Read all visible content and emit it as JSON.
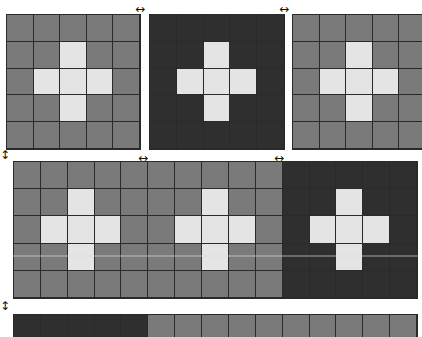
{
  "colors": {
    "grey": "#7a7a7a",
    "dark": "#2f2f2f",
    "light": "#e4e4e4",
    "grid": "#2a2a2a"
  },
  "cross_pattern": [
    [
      0,
      0,
      0,
      0,
      0
    ],
    [
      0,
      0,
      1,
      0,
      0
    ],
    [
      0,
      1,
      1,
      1,
      0
    ],
    [
      0,
      0,
      1,
      0,
      0
    ],
    [
      0,
      0,
      0,
      0,
      0
    ]
  ],
  "top_row": {
    "panels": [
      {
        "name": "panel-top-1",
        "x": 6,
        "y": 14,
        "w": 135,
        "h": 136,
        "cols": 5,
        "rows": 5,
        "base": "grey",
        "cross": true
      },
      {
        "name": "panel-top-2",
        "x": 149,
        "y": 14,
        "w": 136,
        "h": 136,
        "cols": 5,
        "rows": 5,
        "base": "dark",
        "cross": true
      },
      {
        "name": "panel-top-3",
        "x": 292,
        "y": 14,
        "w": 135,
        "h": 136,
        "cols": 5,
        "rows": 5,
        "base": "grey",
        "cross": true
      }
    ]
  },
  "middle_row": {
    "x": 13,
    "y": 161,
    "w": 405,
    "h": 138,
    "cols": 15,
    "rows": 5,
    "blocks": [
      "grey",
      "grey",
      "dark"
    ],
    "cross": true
  },
  "bottom_row": {
    "x": 13,
    "y": 314,
    "w": 405,
    "h": 30,
    "cols": 15,
    "rows": 1,
    "cells": [
      "dark",
      "dark",
      "dark",
      "dark",
      "dark",
      "grey",
      "grey",
      "grey",
      "grey",
      "grey",
      "grey",
      "grey",
      "grey",
      "grey",
      "grey"
    ]
  },
  "resize_handles": [
    {
      "name": "resize-handle-top-1",
      "dir": "h",
      "x": 135,
      "y": 3,
      "glyph": "↔"
    },
    {
      "name": "resize-handle-top-2",
      "dir": "h",
      "x": 279,
      "y": 3,
      "glyph": "↔"
    },
    {
      "name": "resize-handle-mid-1",
      "dir": "h",
      "x": 138,
      "y": 152,
      "glyph": "↔"
    },
    {
      "name": "resize-handle-mid-2",
      "dir": "h",
      "x": 274,
      "y": 152,
      "glyph": "↔"
    },
    {
      "name": "resize-handle-row-1",
      "dir": "v",
      "x": 0,
      "y": 149,
      "glyph": "↕"
    },
    {
      "name": "resize-handle-row-2",
      "dir": "v",
      "x": 0,
      "y": 300,
      "glyph": "↕"
    }
  ]
}
